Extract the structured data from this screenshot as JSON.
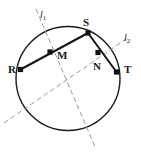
{
  "figure": {
    "canvas": {
      "width": 141,
      "height": 156
    },
    "colors": {
      "stroke": "#1a1a1a",
      "chord": "#141414",
      "dashed": "#9a9a9a",
      "point_fill": "#111111",
      "background": "#ffffff"
    },
    "circle": {
      "name": "main-circle",
      "cx": 68,
      "cy": 78.5,
      "r": 52,
      "stroke_width": 1.4
    },
    "points": [
      {
        "id": "R",
        "label": "R",
        "x": 20.5,
        "y": 69.5,
        "label_x": 8,
        "label_y": 64,
        "on_circle": true,
        "marker": "square"
      },
      {
        "id": "M",
        "label": "M",
        "x": 50.0,
        "y": 52.0,
        "label_x": 57,
        "label_y": 50,
        "on_circle": false,
        "marker": "square"
      },
      {
        "id": "S",
        "label": "S",
        "x": 88.0,
        "y": 33.0,
        "label_x": 83,
        "label_y": 17,
        "on_circle": true,
        "marker": "square"
      },
      {
        "id": "N",
        "label": "N",
        "x": 98.0,
        "y": 52.5,
        "label_x": 93,
        "label_y": 61,
        "on_circle": false,
        "marker": "square"
      },
      {
        "id": "T",
        "label": "T",
        "x": 116.5,
        "y": 72.0,
        "label_x": 124,
        "label_y": 64,
        "on_circle": true,
        "marker": "square"
      }
    ],
    "chords": [
      {
        "id": "RS",
        "name": "chord-rs",
        "from": "R",
        "to": "S",
        "x1": 20.5,
        "y1": 69.5,
        "x2": 88.0,
        "y2": 33.0,
        "stroke_width": 2.0
      },
      {
        "id": "ST",
        "name": "chord-st",
        "from": "S",
        "to": "T",
        "x1": 88.0,
        "y1": 33.0,
        "x2": 116.5,
        "y2": 72.0,
        "stroke_width": 2.0
      }
    ],
    "lines": [
      {
        "id": "l1",
        "label": "l",
        "subscript": "1",
        "name": "perpendicular-bisector-l1",
        "description": "dashed perpendicular bisector of chord RS through M",
        "x1": 36.0,
        "y1": 9.0,
        "x2": 96.0,
        "y2": 149.0,
        "label_x": 40,
        "label_y": 10,
        "dash": "5,3",
        "stroke_width": 1.0
      },
      {
        "id": "l2",
        "label": "l",
        "subscript": "2",
        "name": "perpendicular-bisector-l2",
        "description": "dashed perpendicular bisector of chord ST through N",
        "x1": 4.0,
        "y1": 123.0,
        "x2": 129.0,
        "y2": 37.0,
        "label_x": 124,
        "label_y": 33,
        "dash": "5,3",
        "stroke_width": 1.0
      }
    ]
  }
}
